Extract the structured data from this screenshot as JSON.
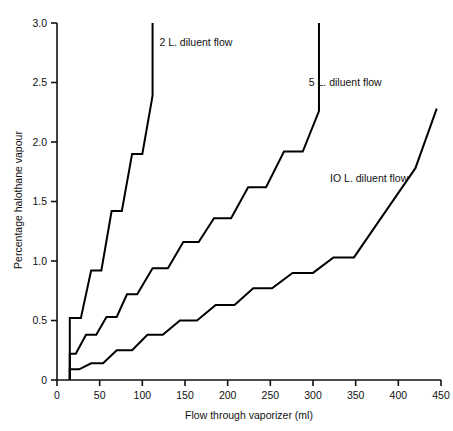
{
  "chart_data": {
    "type": "line",
    "title": "",
    "xlabel": "Flow through vaporizer (ml)",
    "ylabel": "Percentage halothane vapour",
    "xlim": [
      0,
      450
    ],
    "ylim": [
      0,
      3.0
    ],
    "grid": false,
    "legend_position": "inline-annotations",
    "xticks": [
      0,
      50,
      100,
      150,
      200,
      250,
      300,
      350,
      400,
      450
    ],
    "xticklabels": [
      "0",
      "50",
      "100",
      "150",
      "200",
      "250",
      "300",
      "350",
      "400",
      "450"
    ],
    "yticks": [
      0,
      0.5,
      1.0,
      1.5,
      2.0,
      2.5,
      3.0
    ],
    "yticklabels": [
      "0",
      "0.5",
      "1.0",
      "1.5",
      "2.0",
      "2.5",
      "3.0"
    ],
    "line_color": "#000000",
    "line_width": 2.0,
    "background": "#ffffff",
    "drawstyle": "steps-post",
    "annotations": [
      {
        "text": "2 L. diluent flow",
        "x": 120,
        "y": 2.84
      },
      {
        "text": "5 L. diluent flow",
        "x": 295,
        "y": 2.5
      },
      {
        "text": "IO L. diluent flow",
        "x": 320,
        "y": 1.7
      }
    ],
    "series": [
      {
        "name": "2 L. diluent flow",
        "label": "2 L. diluent flow",
        "x": [
          15,
          15,
          28,
          40,
          52,
          64,
          76,
          88,
          100,
          112,
          112
        ],
        "y": [
          0.0,
          0.52,
          0.52,
          0.92,
          0.92,
          1.42,
          1.42,
          1.9,
          1.9,
          2.39,
          3.0
        ]
      },
      {
        "name": "5 L. diluent flow",
        "label": "5 L. diluent flow",
        "x": [
          15,
          15,
          22,
          34,
          46,
          58,
          70,
          82,
          94,
          112,
          130,
          148,
          166,
          184,
          204,
          224,
          245,
          266,
          288,
          307,
          307
        ],
        "y": [
          0.0,
          0.22,
          0.22,
          0.38,
          0.38,
          0.53,
          0.53,
          0.72,
          0.72,
          0.94,
          0.94,
          1.16,
          1.16,
          1.36,
          1.36,
          1.62,
          1.62,
          1.92,
          1.92,
          2.26,
          3.0
        ]
      },
      {
        "name": "IO L. diluent flow",
        "label": "IO L. diluent flow",
        "x": [
          15,
          15,
          26,
          40,
          54,
          70,
          88,
          106,
          124,
          144,
          164,
          186,
          208,
          230,
          252,
          276,
          300,
          324,
          348,
          372,
          396,
          420,
          445
        ],
        "y": [
          0.0,
          0.09,
          0.09,
          0.14,
          0.14,
          0.25,
          0.25,
          0.38,
          0.38,
          0.5,
          0.5,
          0.63,
          0.63,
          0.77,
          0.77,
          0.9,
          0.9,
          1.03,
          1.03,
          1.28,
          1.53,
          1.78,
          2.28
        ]
      }
    ]
  }
}
